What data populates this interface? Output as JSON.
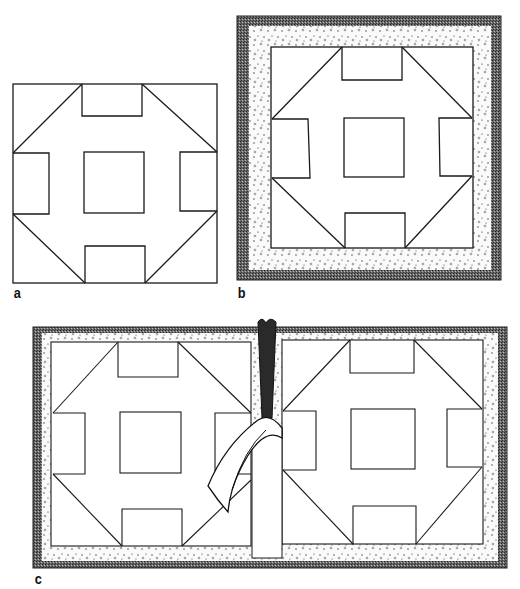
{
  "figure": {
    "labels": {
      "a": "a",
      "b": "b",
      "c": "c"
    },
    "panels": [
      {
        "id": "a",
        "content": "Plain quilt block outline"
      },
      {
        "id": "b",
        "content": "Quilt block mounted with stippled padding and dark textured frame"
      },
      {
        "id": "c",
        "content": "Two quilt blocks side by side in a frame with a folded strip/binding at the center seam"
      }
    ],
    "colors": {
      "line": "#1a1a1a",
      "frame": "#555555",
      "padding": "#f4f4f4",
      "background": "#ffffff"
    }
  }
}
